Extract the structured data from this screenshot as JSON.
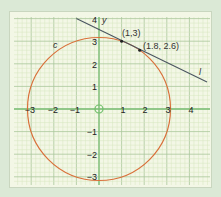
{
  "chart_data": {
    "type": "line",
    "title": "",
    "xlabel": "",
    "ylabel": "y",
    "xlim": [
      -3.5,
      4.9
    ],
    "ylim": [
      -3.4,
      4.1
    ],
    "x_ticks": [
      "-3",
      "-2",
      "-1",
      "1",
      "2",
      "3",
      "4"
    ],
    "y_ticks": [
      "4",
      "3",
      "2",
      "1",
      "-1",
      "-2",
      "-3"
    ],
    "grid": true,
    "series": [
      {
        "name": "c",
        "kind": "circle",
        "equation": "x^2 + y^2 = 10",
        "center": [
          0,
          0
        ],
        "radius": 3.162,
        "color": "#d9703a"
      },
      {
        "name": "l",
        "kind": "line",
        "equation": "y = -0.5x + 3.5",
        "points": [
          [
            -1,
            4
          ],
          [
            4.6,
            1.2
          ]
        ],
        "color": "#4a5560"
      }
    ],
    "annotations": [
      {
        "label": "(1,3)",
        "x": 1,
        "y": 3
      },
      {
        "label": "(1.8, 2.6)",
        "x": 1.8,
        "y": 2.6
      },
      {
        "label": "c",
        "x": -2.0,
        "y": 2.8
      },
      {
        "label": "l",
        "x": 4.4,
        "y": 1.6
      }
    ]
  },
  "labels": {
    "y_axis": "y",
    "curve_c": "c",
    "line_l": "l",
    "point_a": "(1,3)",
    "point_b": "(1.8, 2.6)",
    "x_ticks": [
      "−3",
      "−2",
      "−1",
      "1",
      "2",
      "3",
      "4"
    ],
    "y_ticks": [
      "4",
      "3",
      "2",
      "1",
      "−1",
      "−2",
      "−3"
    ]
  },
  "colors": {
    "grid_minor": "#d6e6bf",
    "grid_major": "#a9c79a",
    "axis": "#7bbf76",
    "circle": "#d9703a",
    "line": "#4a5560"
  }
}
